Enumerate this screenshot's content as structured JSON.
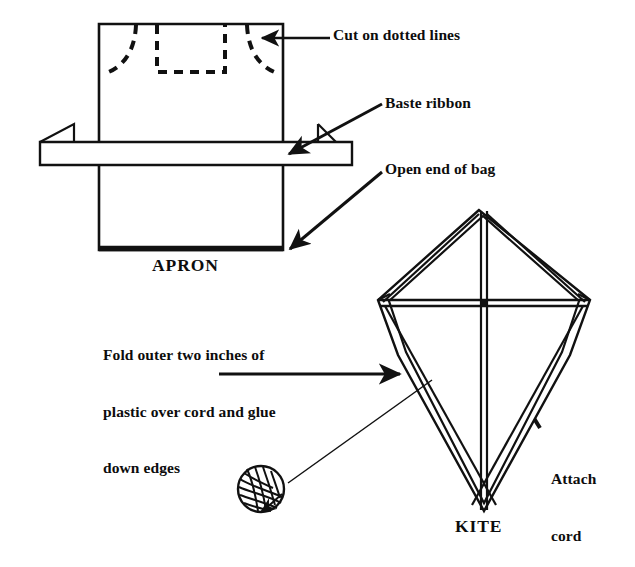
{
  "figure": {
    "background_color": "#ffffff",
    "ink_color": "#111111"
  },
  "labels": {
    "cut_on_dotted_lines": "Cut on dotted lines",
    "baste_ribbon": "Baste ribbon",
    "open_end_of_bag": "Open end of bag",
    "apron": "APRON",
    "fold_instruction_line1": "Fold outer two inches of",
    "fold_instruction_line2": "plastic over cord and glue",
    "fold_instruction_line3": "down edges",
    "attach_cord_line1": "Attach",
    "attach_cord_line2": "cord",
    "kite": "KITE"
  },
  "diagram_parts": {
    "apron_body": "apron-rectangle-outline",
    "neck_cut": "dashed-neck-cut-rectangle",
    "armhole_cut_left": "dashed-left-armhole-curve",
    "armhole_cut_right": "dashed-right-armhole-curve",
    "ribbon_band": "horizontal-ribbon-band-with-folded-left-end",
    "apron_bottom_hem": "open-end-of-bag-bottom-edge",
    "kite_frame": "diamond-kite-outline-with-doubled-folded-edges",
    "kite_spine": "vertical-spine-spar",
    "kite_crossbar": "horizontal-cross-spar",
    "kite_bridle": "bridle-lines-from-corners",
    "cord_ball": "ball-of-cord",
    "cord_line": "cord-running-from-ball-to-kite"
  },
  "arrows": [
    {
      "name": "arrow-cut-on-dotted-lines",
      "from": "label",
      "to": "apron-armhole-cut"
    },
    {
      "name": "arrow-baste-ribbon",
      "from": "label",
      "to": "ribbon-band"
    },
    {
      "name": "arrow-open-end-of-bag",
      "from": "label",
      "to": "apron-bottom-edge"
    },
    {
      "name": "arrow-fold-instruction",
      "from": "label",
      "to": "kite-left-edge"
    },
    {
      "name": "arrow-attach-cord",
      "from": "label",
      "to": "kite-center"
    }
  ]
}
